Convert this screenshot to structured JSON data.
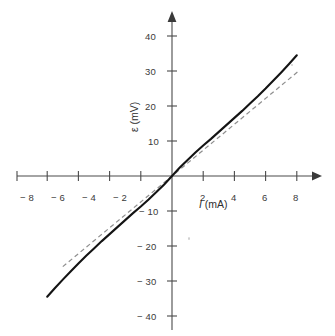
{
  "figure": {
    "name": "current-voltage-characteristic",
    "background_color": "#ffffff",
    "axis_color": "#4a4a4a",
    "curve_color": "#111111",
    "dashed_color": "#8a8a8a"
  },
  "chart_data": {
    "type": "line",
    "title": "",
    "xlabel": "I (mA)",
    "xlabel_symbol": "I",
    "xlabel_unit": "(mA)",
    "ylabel": "ε (mV)",
    "ylabel_symbol": "ε",
    "ylabel_unit": "(mV)",
    "xlim": [
      -8.6,
      8.6
    ],
    "ylim": [
      -41,
      44
    ],
    "grid": false,
    "legend": "none",
    "xticks": [
      -8,
      -6,
      -4,
      -2,
      2,
      4,
      6,
      8
    ],
    "xtick_labels": [
      "− 8",
      "− 6",
      "− 4",
      "− 2",
      "2",
      "4",
      "6",
      "8"
    ],
    "yticks": [
      40,
      30,
      20,
      10,
      -10,
      -20,
      -30,
      -40
    ],
    "ytick_labels": [
      "40",
      "30",
      "20",
      "10",
      "− 10",
      "− 20",
      "− 30",
      "− 40"
    ],
    "series": [
      {
        "name": "measured-characteristic",
        "style": "solid",
        "color": "#111111",
        "x": [
          -8.0,
          -7.5,
          -7.0,
          -6.5,
          -6.0,
          -5.5,
          -5.0,
          -4.5,
          -4.0,
          -3.5,
          -3.0,
          -2.5,
          -2.0,
          -1.5,
          -1.0,
          -0.5,
          0.0,
          0.5,
          1.0,
          1.5,
          2.0,
          2.5,
          3.0,
          3.5,
          4.0,
          4.5,
          5.0,
          5.5,
          6.0,
          6.5,
          7.0,
          7.5,
          8.0
        ],
        "y": [
          -34.5,
          -32.0,
          -29.6,
          -27.3,
          -25.0,
          -22.8,
          -20.7,
          -18.6,
          -16.6,
          -14.6,
          -12.6,
          -10.6,
          -8.7,
          -6.7,
          -4.6,
          -2.4,
          0.0,
          2.4,
          4.6,
          6.7,
          8.7,
          10.6,
          12.6,
          14.6,
          16.6,
          18.6,
          20.7,
          22.8,
          25.0,
          27.3,
          29.6,
          32.0,
          34.5
        ]
      },
      {
        "name": "linear-tangent-approximation",
        "style": "dashed",
        "color": "#8a8a8a",
        "slope_mV_per_mA": 3.7,
        "x": [
          -7.0,
          8.2
        ],
        "y": [
          -25.9,
          30.3
        ]
      }
    ],
    "annotations": []
  },
  "axes": {
    "x_axis_arrow": true,
    "y_axis_arrow": true,
    "origin_label": ""
  }
}
